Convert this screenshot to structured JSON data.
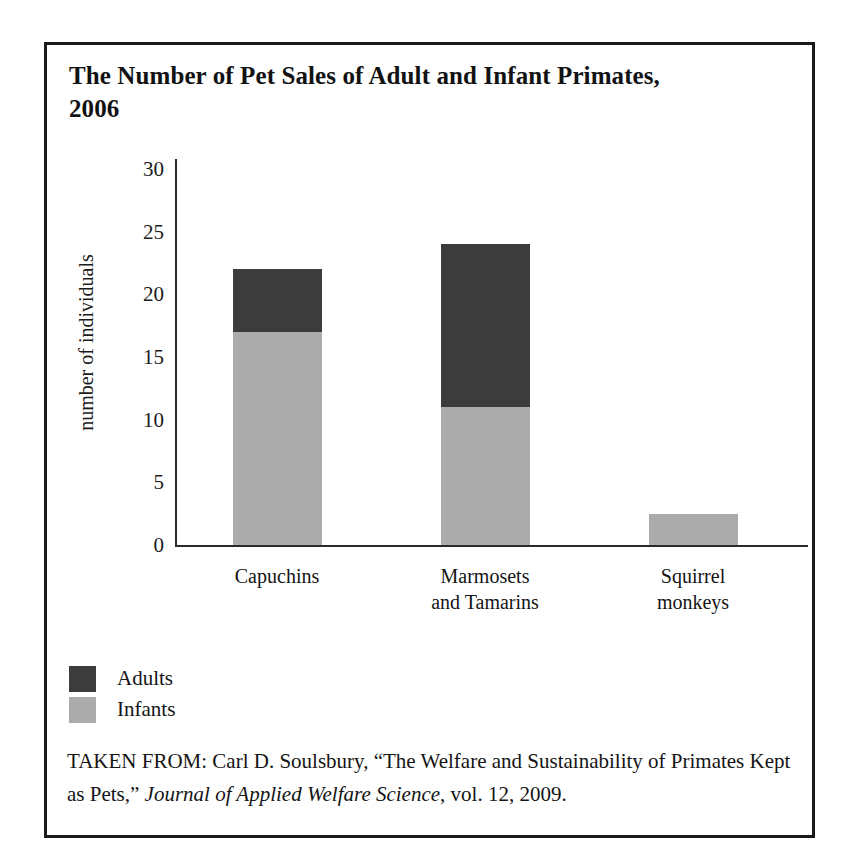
{
  "figure": {
    "title": "The Number of Pet Sales of Adult and Infant Primates, 2006",
    "source_prefix": "TAKEN FROM: Carl D. Soulsbury, “The Welfare and Sustainability of Primates Kept as Pets,” ",
    "source_journal": "Journal of Applied Welfare Science",
    "source_suffix": ", vol. 12, 2009."
  },
  "colors": {
    "adults": "#3c3c3c",
    "infants": "#ababab",
    "frame": "#1a1a1a",
    "axis": "#2a2a2a",
    "background": "#ffffff"
  },
  "legend": {
    "position": "below-plot-left",
    "entries": [
      {
        "label": "Adults",
        "color": "#3c3c3c"
      },
      {
        "label": "Infants",
        "color": "#ababab"
      }
    ]
  },
  "axis": {
    "y_label": "number of individuals",
    "y_ticks": [
      "30",
      "25",
      "20",
      "15",
      "10",
      "5",
      "0"
    ],
    "x_labels": [
      "Capuchins",
      "Marmosets\nand Tamarins",
      "Squirrel\nmonkeys"
    ]
  },
  "chart_data": {
    "type": "bar",
    "stacked": true,
    "title": "The Number of Pet Sales of Adult and Infant Primates, 2006",
    "xlabel": "",
    "ylabel": "number of individuals",
    "ylim": [
      0,
      30
    ],
    "ytick_step": 5,
    "yticks": [
      0,
      5,
      10,
      15,
      20,
      25,
      30
    ],
    "grid": false,
    "legend_position": "bottom-left",
    "categories": [
      "Capuchins",
      "Marmosets and Tamarins",
      "Squirrel monkeys"
    ],
    "series": [
      {
        "name": "Infants",
        "color": "#ababab",
        "values": [
          17,
          11,
          2.5
        ]
      },
      {
        "name": "Adults",
        "color": "#3c3c3c",
        "values": [
          5,
          13,
          0
        ]
      }
    ],
    "totals": [
      22,
      24,
      2.5
    ]
  }
}
